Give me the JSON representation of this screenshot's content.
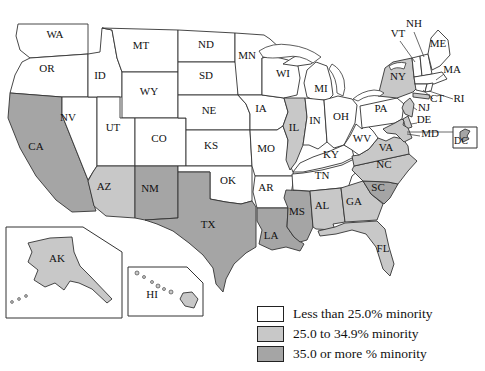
{
  "colors": {
    "low": "#ffffff",
    "mid": "#c8c8c8",
    "high": "#a5a5a5",
    "border": "#333333",
    "label": "#111111"
  },
  "legend": {
    "items": [
      {
        "key": "low",
        "label": "Less than 25.0% minority"
      },
      {
        "key": "mid",
        "label": "25.0 to 34.9% minority"
      },
      {
        "key": "high",
        "label": "35.0 or more % minority"
      }
    ]
  },
  "map": {
    "states": [
      {
        "id": "WA",
        "label": "WA",
        "category": "low",
        "lx": 55,
        "ly": 38
      },
      {
        "id": "OR",
        "label": "OR",
        "category": "low",
        "lx": 47,
        "ly": 72
      },
      {
        "id": "CA",
        "label": "CA",
        "category": "high",
        "lx": 36,
        "ly": 150
      },
      {
        "id": "NV",
        "label": "NV",
        "category": "low",
        "lx": 68,
        "ly": 121
      },
      {
        "id": "ID",
        "label": "ID",
        "category": "low",
        "lx": 100,
        "ly": 79
      },
      {
        "id": "MT",
        "label": "MT",
        "category": "low",
        "lx": 141,
        "ly": 49
      },
      {
        "id": "WY",
        "label": "WY",
        "category": "low",
        "lx": 149,
        "ly": 95
      },
      {
        "id": "UT",
        "label": "UT",
        "category": "low",
        "lx": 113,
        "ly": 131
      },
      {
        "id": "CO",
        "label": "CO",
        "category": "low",
        "lx": 159,
        "ly": 142
      },
      {
        "id": "AZ",
        "label": "AZ",
        "category": "mid",
        "lx": 104,
        "ly": 190
      },
      {
        "id": "NM",
        "label": "NM",
        "category": "high",
        "lx": 150,
        "ly": 192
      },
      {
        "id": "ND",
        "label": "ND",
        "category": "low",
        "lx": 206,
        "ly": 48
      },
      {
        "id": "SD",
        "label": "SD",
        "category": "low",
        "lx": 206,
        "ly": 79
      },
      {
        "id": "NE",
        "label": "NE",
        "category": "low",
        "lx": 209,
        "ly": 114
      },
      {
        "id": "KS",
        "label": "KS",
        "category": "low",
        "lx": 211,
        "ly": 149
      },
      {
        "id": "OK",
        "label": "OK",
        "category": "low",
        "lx": 228,
        "ly": 184
      },
      {
        "id": "TX",
        "label": "TX",
        "category": "high",
        "lx": 208,
        "ly": 228
      },
      {
        "id": "MN",
        "label": "MN",
        "category": "low",
        "lx": 247,
        "ly": 59
      },
      {
        "id": "IA",
        "label": "IA",
        "category": "low",
        "lx": 261,
        "ly": 112
      },
      {
        "id": "MO",
        "label": "MO",
        "category": "low",
        "lx": 266,
        "ly": 152
      },
      {
        "id": "AR",
        "label": "AR",
        "category": "low",
        "lx": 266,
        "ly": 191
      },
      {
        "id": "LA",
        "label": "LA",
        "category": "high",
        "lx": 271,
        "ly": 239
      },
      {
        "id": "WI",
        "label": "WI",
        "category": "low",
        "lx": 283,
        "ly": 77
      },
      {
        "id": "IL",
        "label": "IL",
        "category": "mid",
        "lx": 294,
        "ly": 131
      },
      {
        "id": "MS",
        "label": "MS",
        "category": "high",
        "lx": 297,
        "ly": 215
      },
      {
        "id": "MI",
        "label": "MI",
        "category": "low",
        "lx": 321,
        "ly": 92
      },
      {
        "id": "IN",
        "label": "IN",
        "category": "low",
        "lx": 315,
        "ly": 124
      },
      {
        "id": "OH",
        "label": "OH",
        "category": "low",
        "lx": 341,
        "ly": 120
      },
      {
        "id": "KY",
        "label": "KY",
        "category": "low",
        "lx": 331,
        "ly": 158
      },
      {
        "id": "TN",
        "label": "TN",
        "category": "low",
        "lx": 322,
        "ly": 179
      },
      {
        "id": "AL",
        "label": "AL",
        "category": "mid",
        "lx": 322,
        "ly": 209
      },
      {
        "id": "GA",
        "label": "GA",
        "category": "mid",
        "lx": 354,
        "ly": 205
      },
      {
        "id": "FL",
        "label": "FL",
        "category": "mid",
        "lx": 383,
        "ly": 252
      },
      {
        "id": "SC",
        "label": "SC",
        "category": "high",
        "lx": 378,
        "ly": 191
      },
      {
        "id": "NC",
        "label": "NC",
        "category": "mid",
        "lx": 384,
        "ly": 168
      },
      {
        "id": "VA",
        "label": "VA",
        "category": "mid",
        "lx": 386,
        "ly": 151
      },
      {
        "id": "WV",
        "label": "WV",
        "category": "low",
        "lx": 362,
        "ly": 142
      },
      {
        "id": "PA",
        "label": "PA",
        "category": "low",
        "lx": 381,
        "ly": 112
      },
      {
        "id": "NY",
        "label": "NY",
        "category": "mid",
        "lx": 398,
        "ly": 80
      },
      {
        "id": "VT",
        "label": "VT",
        "category": "low",
        "lx": 398,
        "ly": 37
      },
      {
        "id": "NH",
        "label": "NH",
        "category": "low",
        "lx": 414,
        "ly": 27
      },
      {
        "id": "ME",
        "label": "ME",
        "category": "low",
        "lx": 438,
        "ly": 47
      },
      {
        "id": "MA",
        "label": "MA",
        "category": "low",
        "lx": 452,
        "ly": 73
      },
      {
        "id": "CT",
        "label": "CT",
        "category": "low",
        "lx": 437,
        "ly": 102
      },
      {
        "id": "RI",
        "label": "RI",
        "category": "low",
        "lx": 459,
        "ly": 102
      },
      {
        "id": "NJ",
        "label": "NJ",
        "category": "mid",
        "lx": 424,
        "ly": 111
      },
      {
        "id": "DE",
        "label": "DE",
        "category": "mid",
        "lx": 424,
        "ly": 123
      },
      {
        "id": "MD",
        "label": "MD",
        "category": "mid",
        "lx": 430,
        "ly": 137
      },
      {
        "id": "DC",
        "label": "DC",
        "category": "high",
        "lx": 461,
        "ly": 144
      },
      {
        "id": "AK",
        "label": "AK",
        "category": "mid",
        "lx": 57,
        "ly": 262
      },
      {
        "id": "HI",
        "label": "HI",
        "category": "mid",
        "lx": 152,
        "ly": 298
      }
    ]
  }
}
